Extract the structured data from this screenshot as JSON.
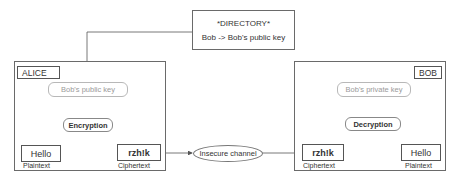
{
  "directory": {
    "title": "*DIRECTORY*",
    "entry": "Bob -> Bob's public key"
  },
  "alice": {
    "name": "ALICE",
    "key": "Bob's public key",
    "operation": "Encryption",
    "plaintext_value": "Hello",
    "plaintext_label": "Plaintext",
    "ciphertext_value": "rzh!k",
    "ciphertext_label": "Ciphertext"
  },
  "channel": {
    "label": "Insecure channel"
  },
  "bob": {
    "name": "BOB",
    "key": "Bob's private key",
    "operation": "Decryption",
    "ciphertext_value": "rzh!k",
    "ciphertext_label": "Ciphertext",
    "plaintext_value": "Hello",
    "plaintext_label": "Plaintext"
  },
  "colors": {
    "line": "#555555",
    "faint_text": "#9a9a9a",
    "border": "#6a6a6a"
  }
}
